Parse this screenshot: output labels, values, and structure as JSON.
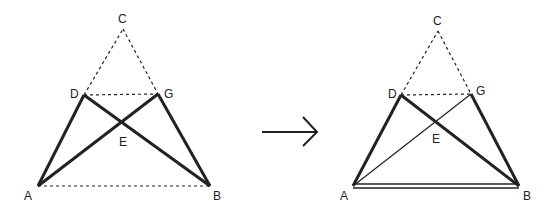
{
  "diagram": {
    "arrow": {
      "direction": "right"
    },
    "left_figure": {
      "points": {
        "A": {
          "label": "A"
        },
        "B": {
          "label": "B"
        },
        "C": {
          "label": "C"
        },
        "D": {
          "label": "D"
        },
        "E": {
          "label": "E"
        },
        "G": {
          "label": "G"
        }
      },
      "segments": [
        {
          "from": "A",
          "to": "D",
          "style": "thick"
        },
        {
          "from": "D",
          "to": "B",
          "style": "thick"
        },
        {
          "from": "A",
          "to": "G",
          "style": "thick"
        },
        {
          "from": "G",
          "to": "B",
          "style": "thick"
        },
        {
          "from": "D",
          "to": "C",
          "style": "dashed"
        },
        {
          "from": "C",
          "to": "G",
          "style": "dashed"
        },
        {
          "from": "D",
          "to": "G",
          "style": "dashed"
        },
        {
          "from": "A",
          "to": "B",
          "style": "dashed"
        }
      ]
    },
    "right_figure": {
      "points": {
        "A": {
          "label": "A"
        },
        "B": {
          "label": "B"
        },
        "C": {
          "label": "C"
        },
        "D": {
          "label": "D"
        },
        "E": {
          "label": "E"
        },
        "G": {
          "label": "G"
        }
      },
      "segments": [
        {
          "from": "A",
          "to": "D",
          "style": "thick"
        },
        {
          "from": "D",
          "to": "B",
          "style": "thick"
        },
        {
          "from": "A",
          "to": "G",
          "style": "thin"
        },
        {
          "from": "G",
          "to": "B",
          "style": "thick"
        },
        {
          "from": "D",
          "to": "C",
          "style": "dashed"
        },
        {
          "from": "C",
          "to": "G",
          "style": "dashed"
        },
        {
          "from": "D",
          "to": "G",
          "style": "dashed"
        },
        {
          "from": "A",
          "to": "B",
          "style": "double"
        }
      ]
    },
    "colors": {
      "stroke": "#222222",
      "background": "#ffffff"
    }
  }
}
